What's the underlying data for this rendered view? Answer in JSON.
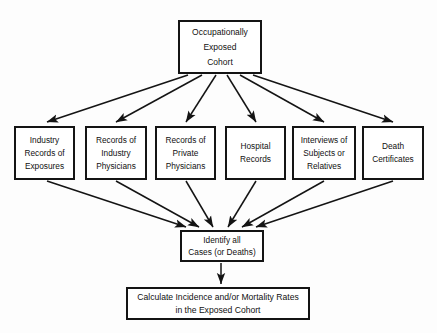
{
  "diagram": {
    "line_color": "#141414",
    "box_fill": "#ffffff",
    "background": "#fdfdfd",
    "nodes": {
      "cohort": {
        "name": "Occupationally Exposed Cohort",
        "lines": [
          "Occupationally",
          "Exposed",
          "Cohort"
        ]
      },
      "industry_records": {
        "name": "Industry Records of Exposures",
        "lines": [
          "Industry",
          "Records of",
          "Exposures"
        ]
      },
      "industry_physicians": {
        "name": "Records of Industry Physicians",
        "lines": [
          "Records of",
          "Industry",
          "Physicians"
        ]
      },
      "private_physicians": {
        "name": "Records of Private Physicians",
        "lines": [
          "Records of",
          "Private",
          "Physicians"
        ]
      },
      "hospital_records": {
        "name": "Hospital Records",
        "lines": [
          "Hospital",
          "Records"
        ]
      },
      "interviews": {
        "name": "Interviews of Subjects or Relatives",
        "lines": [
          "Interviews of",
          "Subjects or",
          "Relatives"
        ]
      },
      "death_certificates": {
        "name": "Death Certificates",
        "lines": [
          "Death",
          "Certificates"
        ]
      },
      "identify": {
        "name": "Identify all Cases (or Deaths)",
        "lines": [
          "Identify all",
          "Cases (or Deaths)"
        ]
      },
      "calculate": {
        "name": "Calculate Incidence and/or Mortality Rates in the Exposed Cohort",
        "lines": [
          "Calculate Incidence and/or Mortality Rates",
          "in the Exposed Cohort"
        ]
      }
    },
    "edges": [
      {
        "from": "cohort",
        "to": "industry_records"
      },
      {
        "from": "cohort",
        "to": "industry_physicians"
      },
      {
        "from": "cohort",
        "to": "private_physicians"
      },
      {
        "from": "cohort",
        "to": "hospital_records"
      },
      {
        "from": "cohort",
        "to": "interviews"
      },
      {
        "from": "cohort",
        "to": "death_certificates"
      },
      {
        "from": "industry_records",
        "to": "identify"
      },
      {
        "from": "industry_physicians",
        "to": "identify"
      },
      {
        "from": "private_physicians",
        "to": "identify"
      },
      {
        "from": "hospital_records",
        "to": "identify"
      },
      {
        "from": "interviews",
        "to": "identify"
      },
      {
        "from": "death_certificates",
        "to": "identify"
      },
      {
        "from": "identify",
        "to": "calculate"
      }
    ]
  }
}
